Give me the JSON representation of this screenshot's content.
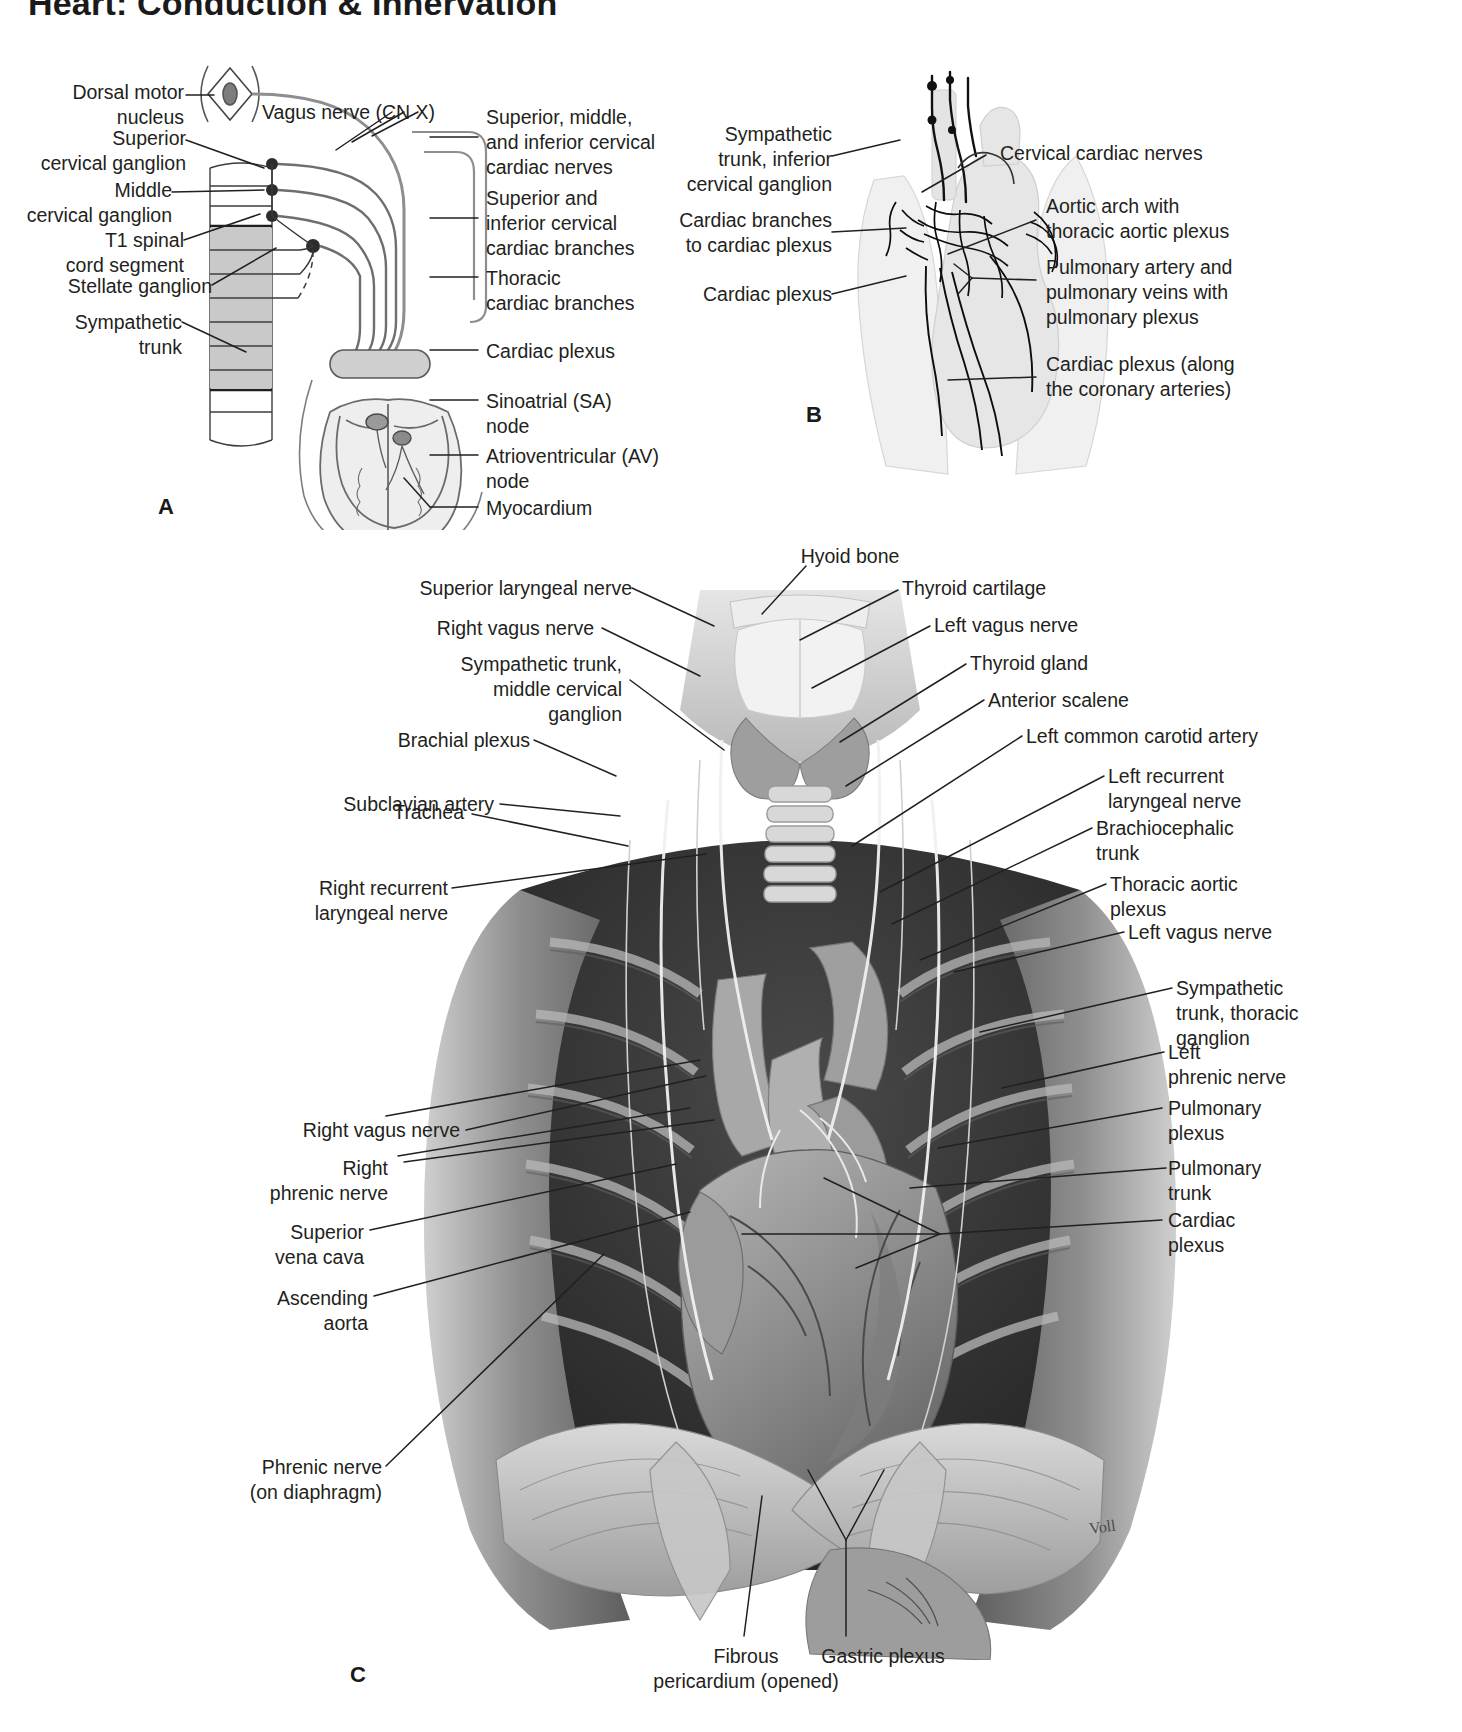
{
  "page": {
    "title": "Heart: Conduction & Innervation",
    "width": 1462,
    "height": 1732,
    "background": "#ffffff",
    "ink": "#231f20"
  },
  "panels": [
    {
      "id": "A",
      "letter": "A",
      "caption": "Autonomic innervation of the heart (schematic)",
      "labels_left": [
        {
          "name": "dorsal-motor-nucleus",
          "text": "Dorsal motor\nnucleus"
        },
        {
          "name": "superior-cervical-ganglion",
          "text": "Superior\ncervical ganglion"
        },
        {
          "name": "middle-cervical-ganglion",
          "text": "Middle\ncervical ganglion"
        },
        {
          "name": "t1-spinal-cord-segment",
          "text": "T1 spinal\ncord segment"
        },
        {
          "name": "stellate-ganglion",
          "text": "Stellate ganglion"
        },
        {
          "name": "sympathetic-trunk",
          "text": "Sympathetic\ntrunk"
        }
      ],
      "labels_inline": [
        {
          "name": "vagus-nerve-cn-x",
          "text": "Vagus nerve (CN X)"
        }
      ],
      "labels_right": [
        {
          "name": "cervical-cardiac-nerves",
          "text": "Superior, middle,\nand inferior cervical\ncardiac nerves"
        },
        {
          "name": "cervical-cardiac-branches",
          "text": "Superior and\ninferior cervical\ncardiac branches"
        },
        {
          "name": "thoracic-cardiac-branches",
          "text": "Thoracic\ncardiac branches"
        },
        {
          "name": "cardiac-plexus",
          "text": "Cardiac plexus"
        },
        {
          "name": "sinoatrial-node",
          "text": "Sinoatrial (SA)\nnode"
        },
        {
          "name": "atrioventricular-node",
          "text": "Atrioventricular (AV)\nnode"
        },
        {
          "name": "myocardium",
          "text": "Myocardium"
        }
      ]
    },
    {
      "id": "B",
      "letter": "B",
      "caption": "Cardiac plexus and thoracic autonomic nerves",
      "labels_left": [
        {
          "name": "sympathetic-trunk-inferior-cervical-ganglion",
          "text": "Sympathetic\ntrunk, inferior\ncervical ganglion"
        },
        {
          "name": "cardiac-branches-to-cardiac-plexus",
          "text": "Cardiac branches\nto cardiac plexus"
        },
        {
          "name": "cardiac-plexus",
          "text": "Cardiac plexus"
        }
      ],
      "labels_right": [
        {
          "name": "cervical-cardiac-nerves",
          "text": "Cervical cardiac nerves"
        },
        {
          "name": "aortic-arch-with-thoracic-aortic-plexus",
          "text": "Aortic arch with\nthoracic aortic plexus"
        },
        {
          "name": "pulmonary-vessels-with-pulmonary-plexus",
          "text": "Pulmonary artery and\npulmonary veins with\npulmonary plexus"
        },
        {
          "name": "cardiac-plexus-coronary-arteries",
          "text": "Cardiac plexus (along\nthe coronary arteries)"
        }
      ]
    },
    {
      "id": "C",
      "letter": "C",
      "caption": "Anterior view of the opened thorax",
      "labels_top": [
        {
          "name": "hyoid-bone",
          "text": "Hyoid bone"
        }
      ],
      "labels_left": [
        {
          "name": "superior-laryngeal-nerve",
          "text": "Superior laryngeal nerve"
        },
        {
          "name": "right-vagus-nerve",
          "text": "Right vagus nerve"
        },
        {
          "name": "sympathetic-trunk-middle-cervical-ganglion",
          "text": "Sympathetic trunk,\nmiddle cervical\nganglion"
        },
        {
          "name": "brachial-plexus",
          "text": "Brachial plexus"
        },
        {
          "name": "subclavian-artery",
          "text": "Subclavian artery"
        },
        {
          "name": "trachea",
          "text": "Trachea"
        },
        {
          "name": "right-recurrent-laryngeal-nerve",
          "text": "Right recurrent\nlaryngeal nerve"
        },
        {
          "name": "right-vagus-nerve-lower",
          "text": "Right vagus nerve"
        },
        {
          "name": "right-phrenic-nerve",
          "text": "Right\nphrenic nerve"
        },
        {
          "name": "superior-vena-cava",
          "text": "Superior\nvena cava"
        },
        {
          "name": "ascending-aorta",
          "text": "Ascending\naorta"
        },
        {
          "name": "phrenic-nerve-on-diaphragm",
          "text": "Phrenic nerve\n(on diaphragm)"
        }
      ],
      "labels_right": [
        {
          "name": "thyroid-cartilage",
          "text": "Thyroid cartilage"
        },
        {
          "name": "left-vagus-nerve",
          "text": "Left vagus nerve"
        },
        {
          "name": "thyroid-gland",
          "text": "Thyroid gland"
        },
        {
          "name": "anterior-scalene",
          "text": "Anterior scalene"
        },
        {
          "name": "left-common-carotid-artery",
          "text": "Left common carotid artery"
        },
        {
          "name": "left-recurrent-laryngeal-nerve",
          "text": "Left recurrent\nlaryngeal nerve"
        },
        {
          "name": "brachiocephalic-trunk",
          "text": "Brachiocephalic\ntrunk"
        },
        {
          "name": "thoracic-aortic-plexus",
          "text": "Thoracic aortic\nplexus"
        },
        {
          "name": "left-vagus-nerve-lower",
          "text": "Left vagus nerve"
        },
        {
          "name": "sympathetic-trunk-thoracic-ganglion",
          "text": "Sympathetic\ntrunk, thoracic\nganglion"
        },
        {
          "name": "left-phrenic-nerve",
          "text": "Left\nphrenic nerve"
        },
        {
          "name": "pulmonary-plexus",
          "text": "Pulmonary\nplexus"
        },
        {
          "name": "pulmonary-trunk",
          "text": "Pulmonary\ntrunk"
        },
        {
          "name": "cardiac-plexus",
          "text": "Cardiac\nplexus"
        }
      ],
      "labels_bottom": [
        {
          "name": "fibrous-pericardium-opened",
          "text": "Fibrous\npericardium (opened)"
        },
        {
          "name": "gastric-plexus",
          "text": "Gastric plexus"
        }
      ],
      "signature": "Voll"
    }
  ]
}
